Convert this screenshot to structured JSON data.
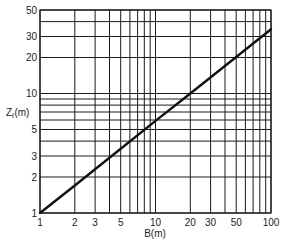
{
  "chart_data": {
    "type": "line",
    "title": "",
    "xlabel": "B(m)",
    "ylabel_main": "Z",
    "ylabel_sub": "ℓ",
    "ylabel_unit": "(m)",
    "xscale": "log",
    "yscale": "log",
    "xlim": [
      1,
      100
    ],
    "ylim": [
      1,
      50
    ],
    "grid": true,
    "x_ticks": [
      1,
      2,
      3,
      5,
      10,
      20,
      30,
      50,
      100
    ],
    "x_tick_labels": [
      "1",
      "2",
      "3",
      "5",
      "10",
      "20",
      "30",
      "50",
      "100"
    ],
    "y_ticks": [
      1,
      2,
      3,
      5,
      10,
      20,
      30,
      50
    ],
    "y_tick_labels": [
      "1",
      "2",
      "3",
      "5",
      "10",
      "20",
      "30",
      "50"
    ],
    "x_gridlines": [
      1,
      2,
      3,
      4,
      5,
      6,
      7,
      8,
      9,
      10,
      20,
      30,
      40,
      50,
      60,
      70,
      80,
      90,
      100
    ],
    "y_gridlines": [
      1,
      2,
      3,
      4,
      5,
      6,
      7,
      8,
      9,
      10,
      20,
      30,
      40,
      50
    ],
    "series": [
      {
        "name": "Zℓ vs B",
        "x": [
          1,
          2,
          5,
          10,
          20,
          50,
          100
        ],
        "y": [
          1,
          1.7,
          3.45,
          5.9,
          10,
          20.2,
          34.5
        ],
        "color": "#111111"
      }
    ],
    "legend": null
  },
  "layout": {
    "plot_left": 40,
    "plot_right": 271,
    "plot_top": 10,
    "plot_bottom": 213
  }
}
